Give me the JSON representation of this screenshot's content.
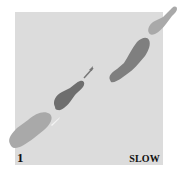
{
  "diagram": {
    "type": "dance-step-footprints",
    "step_count": "1",
    "tempo": "SLOW",
    "colors": {
      "background": "#ffffff",
      "panel": "#dcdcdc",
      "light_foot": "#a9a9a9",
      "dark_foot": "#6e6e6e",
      "mid_foot": "#8a8a8a",
      "highlight": "#f2f2f2"
    },
    "footprints": [
      {
        "id": "start-left-foot",
        "shade": "light"
      },
      {
        "id": "moving-foot-dark",
        "shade": "dark"
      },
      {
        "id": "end-foot-mid",
        "shade": "mid"
      },
      {
        "id": "far-foot-light-toe",
        "shade": "light"
      }
    ],
    "arrow": "direction-arrow"
  }
}
